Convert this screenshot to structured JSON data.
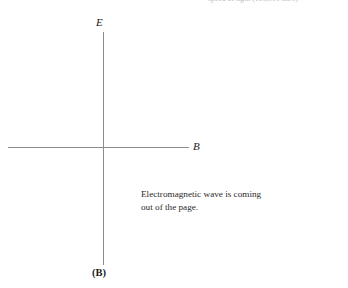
{
  "figure": {
    "background_color": "#ffffff",
    "line_color": "#8c8c8c",
    "text_color": "#1a1a1a",
    "header_fragment": "speed of light (186,000 mi/s)",
    "axes": {
      "vertical_label": "E",
      "horizontal_label": "B",
      "bottom_label": "(B)"
    },
    "caption": {
      "line1": "Electromagnetic wave is coming",
      "line2": "out of the page."
    }
  }
}
